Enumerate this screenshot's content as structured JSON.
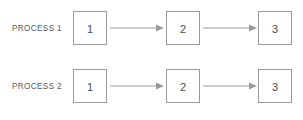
{
  "diagram": {
    "type": "process-flow",
    "background_color": "#ffffff",
    "line_color": "#9a9a9a",
    "text_color": "#5a5a5a",
    "rows": [
      {
        "label": "PROCESS 1",
        "nodes": [
          {
            "label": "1"
          },
          {
            "label": "2"
          },
          {
            "label": "3"
          }
        ],
        "connectors": [
          {
            "from": "1",
            "to": "2",
            "style": "arrow-right"
          },
          {
            "from": "2",
            "to": "3",
            "style": "arrow-right"
          }
        ]
      },
      {
        "label": "PROCESS 2",
        "nodes": [
          {
            "label": "1"
          },
          {
            "label": "2"
          },
          {
            "label": "3"
          }
        ],
        "connectors": [
          {
            "from": "1",
            "to": "2",
            "style": "arrow-right"
          },
          {
            "from": "2",
            "to": "3",
            "style": "arrow-right"
          }
        ]
      }
    ]
  }
}
